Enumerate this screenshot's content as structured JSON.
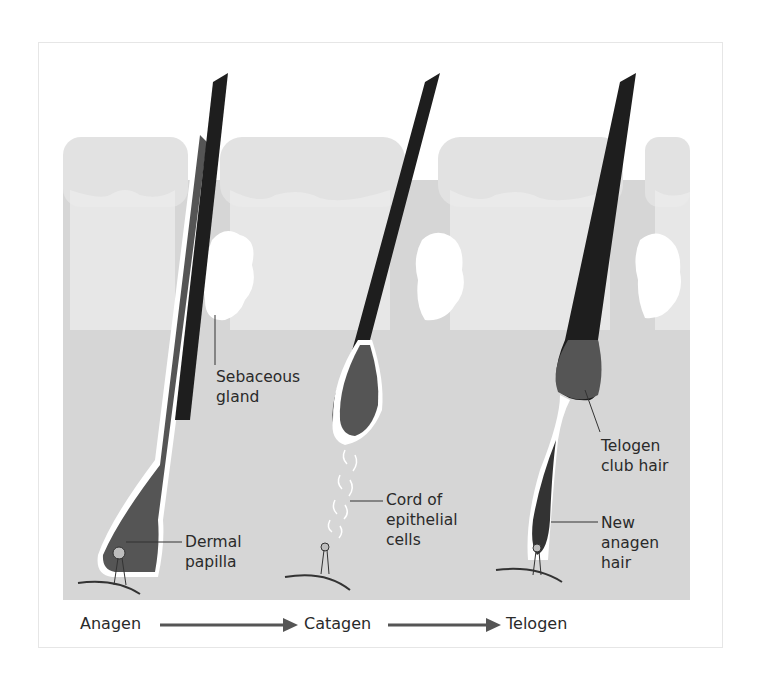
{
  "figure": {
    "colors": {
      "dermis": "#d9d9d9",
      "epidermis_light": "#e6e6e6",
      "hair_shaft": "#1e1e1e",
      "hair_bulb": "#5a5a5a",
      "sheath": "#ffffff",
      "arrow": "#555555",
      "text": "#2a2a2a"
    },
    "labels": {
      "sebaceous_gland": [
        "Sebaceous",
        "gland"
      ],
      "dermal_papilla": [
        "Dermal",
        "papilla"
      ],
      "cord_epithelial": [
        "Cord of",
        "epithelial",
        "cells"
      ],
      "telogen_club_hair": [
        "Telogen",
        "club hair"
      ],
      "new_anagen_hair": [
        "New",
        "anagen",
        "hair"
      ]
    },
    "stages": [
      "Anagen",
      "Catagen",
      "Telogen"
    ]
  }
}
